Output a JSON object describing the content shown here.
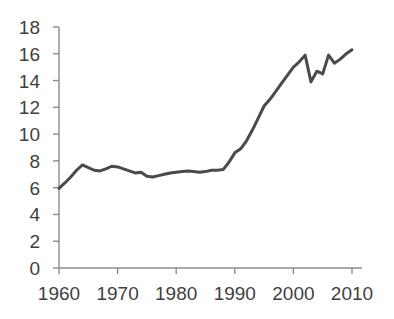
{
  "chart_data": {
    "type": "line",
    "title": "",
    "subtitle": "",
    "xlabel": "",
    "ylabel": "",
    "xlim": [
      1960,
      2010
    ],
    "ylim": [
      0,
      18
    ],
    "yticks": [
      0,
      2,
      4,
      6,
      8,
      10,
      12,
      14,
      16,
      18
    ],
    "ytick_labels": [
      "0",
      "2",
      "4",
      "6",
      "8",
      "10",
      "12",
      "14",
      "16",
      "18"
    ],
    "xticks": [
      1960,
      1970,
      1980,
      1990,
      2000,
      2010
    ],
    "xtick_labels": [
      "1960",
      "1970",
      "1980",
      "1990",
      "2000",
      "2010"
    ],
    "grid": false,
    "legend": null,
    "legend_position": "none",
    "annotations": [],
    "line_color": "#4a4a4a",
    "line_width": 3,
    "axis_color": "#8c8c8c",
    "series": [
      {
        "name": "series-1",
        "x": [
          1960,
          1961,
          1962,
          1963,
          1964,
          1965,
          1966,
          1967,
          1968,
          1969,
          1970,
          1971,
          1972,
          1973,
          1974,
          1975,
          1976,
          1977,
          1978,
          1979,
          1980,
          1981,
          1982,
          1983,
          1984,
          1985,
          1986,
          1987,
          1988,
          1989,
          1990,
          1991,
          1992,
          1993,
          1994,
          1995,
          1996,
          1997,
          1998,
          1999,
          2000,
          2001,
          2002,
          2003,
          2004,
          2005,
          2006,
          2007,
          2008,
          2009,
          2010
        ],
        "values": [
          5.95,
          6.35,
          6.8,
          7.3,
          7.7,
          7.5,
          7.3,
          7.25,
          7.4,
          7.6,
          7.55,
          7.4,
          7.25,
          7.1,
          7.15,
          6.85,
          6.8,
          6.9,
          7.0,
          7.1,
          7.15,
          7.2,
          7.25,
          7.2,
          7.15,
          7.2,
          7.3,
          7.3,
          7.35,
          7.9,
          8.6,
          8.9,
          9.5,
          10.3,
          11.2,
          12.1,
          12.6,
          13.2,
          13.8,
          14.4,
          15.0,
          15.4,
          15.9,
          13.9,
          14.7,
          14.5,
          15.9,
          15.3,
          15.6,
          16.0,
          16.3
        ]
      }
    ]
  }
}
